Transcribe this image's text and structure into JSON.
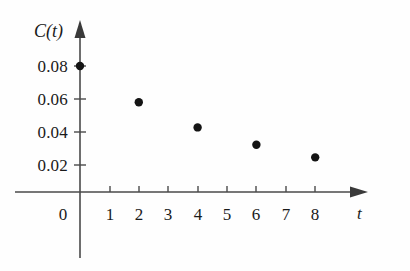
{
  "chart_data": {
    "type": "scatter",
    "title": "",
    "xlabel": "t",
    "ylabel": "C(t)",
    "x": [
      0,
      2,
      4,
      6,
      8
    ],
    "values": [
      0.08,
      0.057,
      0.041,
      0.03,
      0.022
    ],
    "points": [
      {
        "x": 0,
        "y": 0.08
      },
      {
        "x": 2,
        "y": 0.057
      },
      {
        "x": 4,
        "y": 0.041
      },
      {
        "x": 6,
        "y": 0.03
      },
      {
        "x": 8,
        "y": 0.022
      }
    ],
    "xlim": [
      0,
      9.4
    ],
    "ylim": [
      0,
      0.0965
    ],
    "xticks": [
      1,
      2,
      3,
      4,
      5,
      6,
      7,
      8
    ],
    "xtick_labels": [
      "1",
      "2",
      "3",
      "4",
      "5",
      "6",
      "7",
      "8"
    ],
    "yticks": [
      0.02,
      0.04,
      0.06,
      0.08
    ],
    "ytick_labels": [
      "0.02",
      "0.04",
      "0.06",
      "0.08"
    ],
    "origin_label": "0",
    "grid": false,
    "legend": null,
    "marker_color": "#141414",
    "axis_color": "#4a4a4a"
  },
  "axes": {
    "y_axis_title": "C(t)",
    "x_axis_title": "t",
    "origin_label": "0",
    "y_tick_labels": [
      "0.08",
      "0.06",
      "0.04",
      "0.02"
    ],
    "x_tick_labels": [
      "1",
      "2",
      "3",
      "4",
      "5",
      "6",
      "7",
      "8"
    ]
  }
}
